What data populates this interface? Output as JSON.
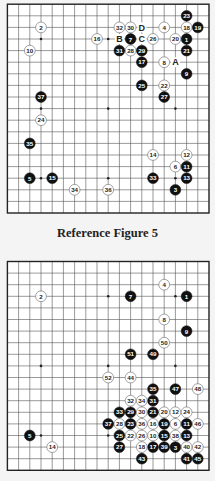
{
  "figures": [
    {
      "id": "board-1",
      "caption": "Reference Figure 5",
      "board_size": 19,
      "stones": [
        {
          "n": "1",
          "color": "black",
          "c": 16,
          "r": 3
        },
        {
          "n": "2",
          "color": "white",
          "c": 3,
          "r": 2
        },
        {
          "n": "3",
          "color": "black",
          "c": 15,
          "r": 16
        },
        {
          "n": "4",
          "color": "white",
          "c": 14,
          "r": 2
        },
        {
          "n": "5",
          "color": "black",
          "c": 2,
          "r": 15
        },
        {
          "n": "6",
          "color": "white",
          "c": 15,
          "r": 14
        },
        {
          "n": "7",
          "color": "black",
          "c": 11,
          "r": 3
        },
        {
          "n": "8",
          "color": "white",
          "c": 14,
          "r": 5
        },
        {
          "n": "9",
          "color": "black",
          "c": 16,
          "r": 6
        },
        {
          "n": "10",
          "color": "white",
          "c": 2,
          "r": 4
        },
        {
          "n": "11",
          "color": "black",
          "c": 16,
          "r": 14
        },
        {
          "n": "12",
          "color": "white",
          "c": 16,
          "r": 13
        },
        {
          "n": "13",
          "color": "black",
          "c": 16,
          "r": 15
        },
        {
          "n": "14",
          "color": "white",
          "c": 13,
          "r": 13
        },
        {
          "n": "15",
          "color": "black",
          "c": 4,
          "r": 15
        },
        {
          "n": "16",
          "color": "white",
          "c": 8,
          "r": 3
        },
        {
          "n": "17",
          "color": "black",
          "c": 12,
          "r": 5
        },
        {
          "n": "18",
          "color": "white",
          "c": 16,
          "r": 2
        },
        {
          "n": "19",
          "color": "black",
          "c": 17,
          "r": 2
        },
        {
          "n": "20",
          "color": "white",
          "c": 15,
          "r": 3
        },
        {
          "n": "21",
          "color": "black",
          "c": 16,
          "r": 4
        },
        {
          "n": "22",
          "color": "white",
          "c": 14,
          "r": 7
        },
        {
          "n": "23",
          "color": "black",
          "c": 16,
          "r": 1
        },
        {
          "n": "24",
          "color": "white",
          "c": 3,
          "r": 10
        },
        {
          "n": "25",
          "color": "black",
          "c": 12,
          "r": 7
        },
        {
          "n": "26",
          "color": "white",
          "c": 13,
          "r": 3
        },
        {
          "n": "27",
          "color": "black",
          "c": 14,
          "r": 8
        },
        {
          "n": "28",
          "color": "white",
          "c": 11,
          "r": 4
        },
        {
          "n": "29",
          "color": "black",
          "c": 12,
          "r": 4
        },
        {
          "n": "30",
          "color": "white",
          "c": 11,
          "r": 2
        },
        {
          "n": "31",
          "color": "black",
          "c": 10,
          "r": 4
        },
        {
          "n": "32",
          "color": "white",
          "c": 10,
          "r": 2
        },
        {
          "n": "33",
          "color": "black",
          "c": 13,
          "r": 15
        },
        {
          "n": "34",
          "color": "white",
          "c": 6,
          "r": 16
        },
        {
          "n": "35",
          "color": "black",
          "c": 2,
          "r": 12
        },
        {
          "n": "36",
          "color": "white",
          "c": 9,
          "r": 16
        },
        {
          "n": "37",
          "color": "black",
          "c": 3,
          "r": 8
        }
      ],
      "letters": [
        {
          "t": "A",
          "c": 15,
          "r": 5
        },
        {
          "t": "B",
          "c": 10,
          "r": 3
        },
        {
          "t": "C",
          "c": 12,
          "r": 3
        },
        {
          "t": "D",
          "c": 12,
          "r": 2
        }
      ]
    },
    {
      "id": "board-2",
      "caption": "",
      "board_size": 19,
      "stones": [
        {
          "n": "1",
          "color": "black",
          "c": 16,
          "r": 3
        },
        {
          "n": "2",
          "color": "white",
          "c": 3,
          "r": 3
        },
        {
          "n": "3",
          "color": "black",
          "c": 15,
          "r": 16
        },
        {
          "n": "4",
          "color": "white",
          "c": 14,
          "r": 2
        },
        {
          "n": "5",
          "color": "black",
          "c": 2,
          "r": 15
        },
        {
          "n": "6",
          "color": "white",
          "c": 15,
          "r": 14
        },
        {
          "n": "7",
          "color": "black",
          "c": 11,
          "r": 3
        },
        {
          "n": "8",
          "color": "white",
          "c": 14,
          "r": 5
        },
        {
          "n": "9",
          "color": "black",
          "c": 16,
          "r": 6
        },
        {
          "n": "10",
          "color": "white",
          "c": 13,
          "r": 15
        },
        {
          "n": "11",
          "color": "black",
          "c": 16,
          "r": 14
        },
        {
          "n": "12",
          "color": "white",
          "c": 15,
          "r": 13
        },
        {
          "n": "13",
          "color": "black",
          "c": 16,
          "r": 15
        },
        {
          "n": "14",
          "color": "white",
          "c": 4,
          "r": 16
        },
        {
          "n": "15",
          "color": "black",
          "c": 14,
          "r": 15
        },
        {
          "n": "16",
          "color": "white",
          "c": 13,
          "r": 14
        },
        {
          "n": "17",
          "color": "black",
          "c": 13,
          "r": 16
        },
        {
          "n": "18",
          "color": "white",
          "c": 12,
          "r": 16
        },
        {
          "n": "19",
          "color": "black",
          "c": 14,
          "r": 14
        },
        {
          "n": "20",
          "color": "white",
          "c": 14,
          "r": 13
        },
        {
          "n": "21",
          "color": "black",
          "c": 13,
          "r": 13
        },
        {
          "n": "22",
          "color": "white",
          "c": 11,
          "r": 15
        },
        {
          "n": "23",
          "color": "black",
          "c": 11,
          "r": 14
        },
        {
          "n": "24",
          "color": "white",
          "c": 16,
          "r": 13
        },
        {
          "n": "25",
          "color": "black",
          "c": 10,
          "r": 15
        },
        {
          "n": "26",
          "color": "white",
          "c": 12,
          "r": 15
        },
        {
          "n": "27",
          "color": "black",
          "c": 10,
          "r": 16
        },
        {
          "n": "28",
          "color": "white",
          "c": 10,
          "r": 14
        },
        {
          "n": "29",
          "color": "black",
          "c": 11,
          "r": 13
        },
        {
          "n": "30",
          "color": "white",
          "c": 12,
          "r": 13
        },
        {
          "n": "31",
          "color": "black",
          "c": 13,
          "r": 12
        },
        {
          "n": "32",
          "color": "white",
          "c": 11,
          "r": 12
        },
        {
          "n": "33",
          "color": "black",
          "c": 10,
          "r": 13
        },
        {
          "n": "34",
          "color": "white",
          "c": 12,
          "r": 12
        },
        {
          "n": "35",
          "color": "black",
          "c": 13,
          "r": 11
        },
        {
          "n": "36",
          "color": "white",
          "c": 12,
          "r": 14
        },
        {
          "n": "37",
          "color": "black",
          "c": 9,
          "r": 14
        },
        {
          "n": "38",
          "color": "white",
          "c": 15,
          "r": 15
        },
        {
          "n": "39",
          "color": "black",
          "c": 14,
          "r": 16
        },
        {
          "n": "40",
          "color": "white",
          "c": 16,
          "r": 16
        },
        {
          "n": "41",
          "color": "black",
          "c": 16,
          "r": 17
        },
        {
          "n": "42",
          "color": "white",
          "c": 17,
          "r": 16
        },
        {
          "n": "43",
          "color": "black",
          "c": 12,
          "r": 17
        },
        {
          "n": "44",
          "color": "white",
          "c": 11,
          "r": 10
        },
        {
          "n": "45",
          "color": "black",
          "c": 17,
          "r": 17
        },
        {
          "n": "46",
          "color": "white",
          "c": 17,
          "r": 14
        },
        {
          "n": "47",
          "color": "black",
          "c": 15,
          "r": 11
        },
        {
          "n": "48",
          "color": "white",
          "c": 17,
          "r": 11
        },
        {
          "n": "49",
          "color": "black",
          "c": 13,
          "r": 8
        },
        {
          "n": "50",
          "color": "white",
          "c": 14,
          "r": 7
        },
        {
          "n": "51",
          "color": "black",
          "c": 11,
          "r": 8
        },
        {
          "n": "52",
          "color": "white",
          "c": 9,
          "r": 10
        }
      ],
      "letters": []
    }
  ],
  "colors": {
    "background": "#f4f4f4",
    "board": "#ffffff",
    "grid": "#555555",
    "border": "#222222",
    "black_stone": "#111111",
    "white_stone": "#ffffff"
  }
}
